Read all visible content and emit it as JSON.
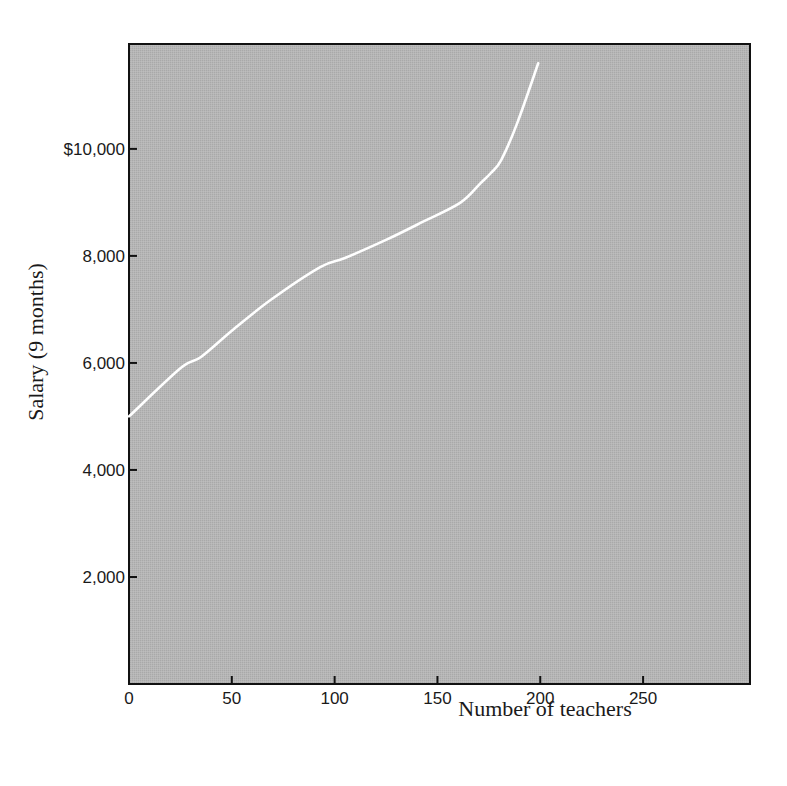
{
  "chart_data": {
    "type": "line",
    "title": "",
    "xlabel": "Number of teachers",
    "ylabel": "Salary (9 months)",
    "xlim": [
      0,
      302
    ],
    "ylim": [
      0,
      11960
    ],
    "x_ticks": [
      0,
      50,
      100,
      150,
      200,
      250
    ],
    "x_tick_labels": [
      "0",
      "50",
      "100",
      "150",
      "200",
      "250"
    ],
    "y_ticks": [
      2000,
      4000,
      6000,
      8000,
      10000
    ],
    "y_tick_labels": [
      "2,000",
      "4,000",
      "6,000",
      "8,000",
      "$10,000"
    ],
    "grid": false,
    "legend": null,
    "background_color": "#b4b4b4",
    "line_color": "#ffffff",
    "series": [
      {
        "name": "Salary distribution",
        "x": [
          0,
          25,
          35,
          50,
          69,
          93,
          105,
          125,
          142,
          161,
          171,
          176,
          181,
          189,
          199
        ],
        "y": [
          5000,
          5900,
          6110,
          6600,
          7180,
          7790,
          7960,
          8300,
          8620,
          8990,
          9360,
          9550,
          9790,
          10500,
          11600
        ]
      }
    ]
  },
  "layout": {
    "plot_left": 129,
    "plot_top": 44,
    "plot_right": 750,
    "plot_bottom": 684
  }
}
